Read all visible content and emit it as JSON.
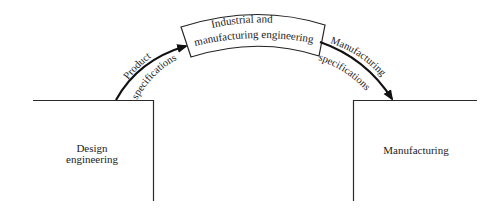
{
  "diagram": {
    "type": "flow",
    "nodes": {
      "design": {
        "label_line1": "Design",
        "label_line2": "engineering"
      },
      "industrial": {
        "label_line1": "Industrial and",
        "label_line2": "manufacturing engineering"
      },
      "manufacturing": {
        "label": "Manufacturing"
      }
    },
    "edges": {
      "product_spec": {
        "label_upper": "Product",
        "label_lower": "specifications",
        "from": "Design engineering",
        "to": "Industrial and manufacturing engineering"
      },
      "manufacturing_spec": {
        "label_upper": "Manufacturing",
        "label_lower": "specifications",
        "from": "Industrial and manufacturing engineering",
        "to": "Manufacturing"
      }
    },
    "colors": {
      "line": "#222222",
      "background": "#ffffff"
    }
  }
}
